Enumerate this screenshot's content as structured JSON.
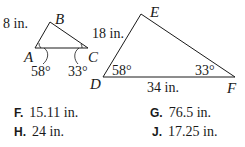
{
  "figure": {
    "small_triangle": {
      "vertices": {
        "A": "A",
        "B": "B",
        "C": "C"
      },
      "side_AB": "8 in.",
      "angle_A": "58°",
      "angle_C": "33°"
    },
    "large_triangle": {
      "vertices": {
        "D": "D",
        "E": "E",
        "F": "F"
      },
      "side_DE": "18 in.",
      "side_DF": "34 in.",
      "angle_D": "58°",
      "angle_F": "33°"
    }
  },
  "answers": [
    {
      "key": "F.",
      "value": "15.11 in."
    },
    {
      "key": "G.",
      "value": "76.5 in."
    },
    {
      "key": "H.",
      "value": "24 in."
    },
    {
      "key": "J.",
      "value": "17.25 in."
    }
  ]
}
